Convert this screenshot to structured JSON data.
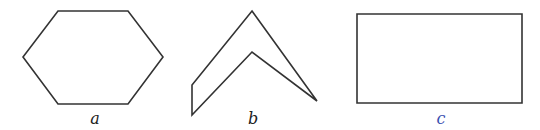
{
  "figure": {
    "shapes": [
      {
        "id": "a",
        "type": "hexagon",
        "label": "a",
        "label_color": "#222222",
        "points": "58,11 128,11 163,57 128,104 58,104 23,57",
        "label_pos": [
          95,
          109
        ]
      },
      {
        "id": "b",
        "type": "chevron",
        "label": "b",
        "label_color": "#222222",
        "points": "252,11 317,101 252,52 192,115 192,85",
        "label_pos": [
          253,
          109
        ]
      },
      {
        "id": "c",
        "type": "rectangle",
        "label": "c",
        "label_color": "#3a4fb0",
        "points": "357,14 522,14 522,103 357,103",
        "label_pos": [
          441,
          109
        ]
      }
    ],
    "stroke_color": "#333333"
  }
}
